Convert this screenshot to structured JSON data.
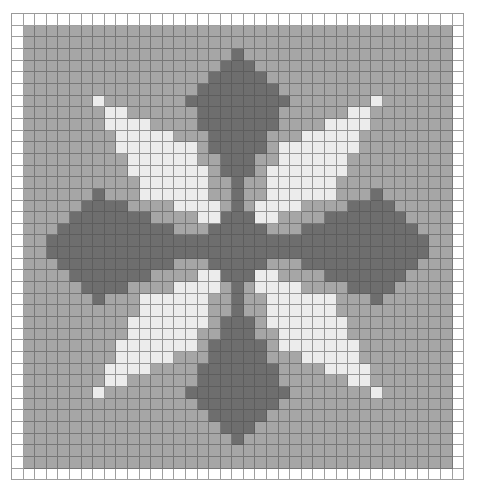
{
  "pattern": {
    "cols": 39,
    "rows": 40,
    "colors": {
      "W": "#ffffff",
      "G": "#a6a6a6",
      "D": "#6e6e6e",
      "L": "#ececec"
    },
    "background_code": "G",
    "border_code": "W",
    "motif_top_half": [
      {
        "row": 3,
        "dark": [
          [
            19,
            19
          ]
        ],
        "light": []
      },
      {
        "row": 4,
        "dark": [
          [
            18,
            19
          ]
        ],
        "light": []
      },
      {
        "row": 5,
        "dark": [
          [
            17,
            19
          ]
        ],
        "light": []
      },
      {
        "row": 6,
        "dark": [
          [
            16,
            19
          ]
        ],
        "light": []
      },
      {
        "row": 7,
        "dark": [
          [
            15,
            19
          ]
        ],
        "light": [
          [
            7,
            7
          ]
        ]
      },
      {
        "row": 8,
        "dark": [
          [
            16,
            19
          ]
        ],
        "light": [
          [
            8,
            9
          ]
        ]
      },
      {
        "row": 9,
        "dark": [
          [
            16,
            19
          ]
        ],
        "light": [
          [
            8,
            11
          ]
        ]
      },
      {
        "row": 10,
        "dark": [
          [
            17,
            19
          ]
        ],
        "light": [
          [
            9,
            13
          ]
        ]
      },
      {
        "row": 11,
        "dark": [
          [
            17,
            19
          ]
        ],
        "light": [
          [
            9,
            15
          ]
        ]
      },
      {
        "row": 12,
        "dark": [
          [
            18,
            19
          ]
        ],
        "light": [
          [
            10,
            15
          ]
        ]
      },
      {
        "row": 13,
        "dark": [
          [
            18,
            19
          ]
        ],
        "light": [
          [
            10,
            16
          ]
        ]
      },
      {
        "row": 14,
        "dark": [
          [
            19,
            19
          ]
        ],
        "light": [
          [
            11,
            16
          ]
        ]
      },
      {
        "row": 15,
        "dark": [
          [
            7,
            7
          ],
          [
            19,
            19
          ]
        ],
        "light": [
          [
            11,
            16
          ]
        ]
      },
      {
        "row": 16,
        "dark": [
          [
            6,
            9
          ],
          [
            19,
            19
          ]
        ],
        "light": [
          [
            14,
            17
          ]
        ]
      },
      {
        "row": 17,
        "dark": [
          [
            5,
            11
          ],
          [
            18,
            19
          ]
        ],
        "light": [
          [
            16,
            17
          ]
        ]
      },
      {
        "row": 18,
        "dark": [
          [
            4,
            13
          ],
          [
            17,
            19
          ]
        ],
        "light": []
      },
      {
        "row": 19,
        "dark": [
          [
            3,
            19
          ]
        ],
        "light": []
      }
    ],
    "mirror_row_sum": 39,
    "mirror_col_sum": 38
  }
}
